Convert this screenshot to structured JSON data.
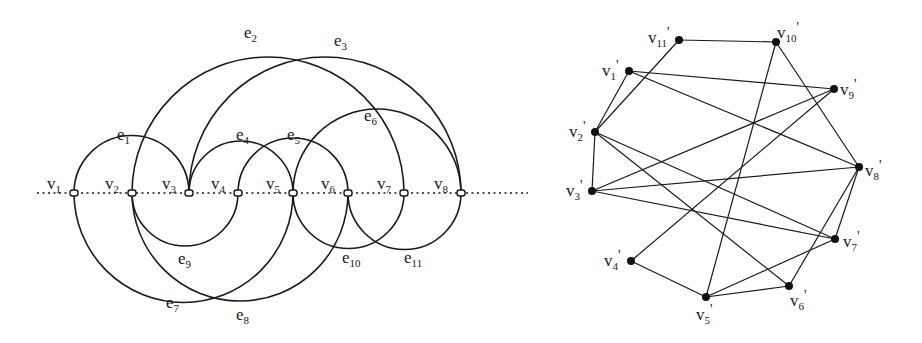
{
  "left_graph": {
    "baseline": {
      "x1": 37,
      "x2": 528,
      "y": 193
    },
    "vertices": [
      {
        "id": "v1",
        "label": "v",
        "sub": "1",
        "x": 74
      },
      {
        "id": "v2",
        "label": "v",
        "sub": "2",
        "x": 132
      },
      {
        "id": "v3",
        "label": "v",
        "sub": "3",
        "x": 189
      },
      {
        "id": "v4",
        "label": "v",
        "sub": "4",
        "x": 238
      },
      {
        "id": "v5",
        "label": "v",
        "sub": "5",
        "x": 293
      },
      {
        "id": "v6",
        "label": "v",
        "sub": "6",
        "x": 348
      },
      {
        "id": "v7",
        "label": "v",
        "sub": "7",
        "x": 404
      },
      {
        "id": "v8",
        "label": "v",
        "sub": "8",
        "x": 461
      }
    ],
    "edges": [
      {
        "id": "e1",
        "label": "e",
        "sub": "1",
        "from": "v1",
        "to": "v3",
        "side": "upper",
        "lx": 117,
        "ly": 140
      },
      {
        "id": "e2",
        "label": "e",
        "sub": "2",
        "from": "v2",
        "to": "v7",
        "side": "upper",
        "lx": 244,
        "ly": 38
      },
      {
        "id": "e3",
        "label": "e",
        "sub": "3",
        "from": "v3",
        "to": "v8",
        "side": "upper",
        "lx": 334,
        "ly": 46
      },
      {
        "id": "e4",
        "label": "e",
        "sub": "4",
        "from": "v3",
        "to": "v5",
        "side": "upper",
        "lx": 236,
        "ly": 140
      },
      {
        "id": "e5",
        "label": "e",
        "sub": "5",
        "from": "v4",
        "to": "v6",
        "side": "upper",
        "lx": 287,
        "ly": 140
      },
      {
        "id": "e6",
        "label": "e",
        "sub": "6",
        "from": "v5",
        "to": "v8",
        "side": "upper",
        "lx": 364,
        "ly": 121
      },
      {
        "id": "e7",
        "label": "e",
        "sub": "7",
        "from": "v1",
        "to": "v5",
        "side": "lower",
        "lx": 166,
        "ly": 308
      },
      {
        "id": "e8",
        "label": "e",
        "sub": "8",
        "from": "v2",
        "to": "v6",
        "side": "lower",
        "lx": 236,
        "ly": 320
      },
      {
        "id": "e9",
        "label": "e",
        "sub": "9",
        "from": "v2",
        "to": "v4",
        "side": "lower",
        "lx": 178,
        "ly": 264
      },
      {
        "id": "e10",
        "label": "e",
        "sub": "10",
        "from": "v5",
        "to": "v7",
        "side": "lower",
        "lx": 342,
        "ly": 263
      },
      {
        "id": "e11",
        "label": "e",
        "sub": "11",
        "from": "v6",
        "to": "v8",
        "side": "lower",
        "lx": 404,
        "ly": 263
      }
    ]
  },
  "right_graph": {
    "vertices": [
      {
        "id": "v1p",
        "label": "v",
        "sub": "1",
        "prime": "'",
        "x": 629,
        "y": 71,
        "lx": 602,
        "ly": 76
      },
      {
        "id": "v2p",
        "label": "v",
        "sub": "2",
        "prime": "'",
        "x": 595,
        "y": 132,
        "lx": 569,
        "ly": 137
      },
      {
        "id": "v3p",
        "label": "v",
        "sub": "3",
        "prime": "'",
        "x": 592,
        "y": 191,
        "lx": 566,
        "ly": 196
      },
      {
        "id": "v4p",
        "label": "v",
        "sub": "4",
        "prime": "'",
        "x": 631,
        "y": 261,
        "lx": 604,
        "ly": 266
      },
      {
        "id": "v5p",
        "label": "v",
        "sub": "5",
        "prime": "'",
        "x": 706,
        "y": 297,
        "lx": 696,
        "ly": 320
      },
      {
        "id": "v6p",
        "label": "v",
        "sub": "6",
        "prime": "'",
        "x": 789,
        "y": 286,
        "lx": 790,
        "ly": 306
      },
      {
        "id": "v7p",
        "label": "v",
        "sub": "7",
        "prime": "'",
        "x": 835,
        "y": 239,
        "lx": 843,
        "ly": 247
      },
      {
        "id": "v8p",
        "label": "v",
        "sub": "8",
        "prime": "'",
        "x": 859,
        "y": 167,
        "lx": 865,
        "ly": 176
      },
      {
        "id": "v9p",
        "label": "v",
        "sub": "9",
        "prime": "'",
        "x": 834,
        "y": 89,
        "lx": 840,
        "ly": 95
      },
      {
        "id": "v10p",
        "label": "v",
        "sub": "10",
        "prime": "'",
        "x": 776,
        "y": 42,
        "lx": 777,
        "ly": 38
      },
      {
        "id": "v11p",
        "label": "v",
        "sub": "11",
        "prime": "'",
        "x": 679,
        "y": 40,
        "lx": 648,
        "ly": 43
      }
    ],
    "edges": [
      [
        "v11p",
        "v10p"
      ],
      [
        "v11p",
        "v2p"
      ],
      [
        "v1p",
        "v9p"
      ],
      [
        "v1p",
        "v2p"
      ],
      [
        "v1p",
        "v8p"
      ],
      [
        "v10p",
        "v8p"
      ],
      [
        "v10p",
        "v5p"
      ],
      [
        "v9p",
        "v3p"
      ],
      [
        "v9p",
        "v4p"
      ],
      [
        "v2p",
        "v3p"
      ],
      [
        "v2p",
        "v7p"
      ],
      [
        "v2p",
        "v6p"
      ],
      [
        "v3p",
        "v8p"
      ],
      [
        "v3p",
        "v7p"
      ],
      [
        "v4p",
        "v5p"
      ],
      [
        "v5p",
        "v6p"
      ],
      [
        "v5p",
        "v7p"
      ],
      [
        "v8p",
        "v7p"
      ],
      [
        "v8p",
        "v6p"
      ]
    ]
  }
}
